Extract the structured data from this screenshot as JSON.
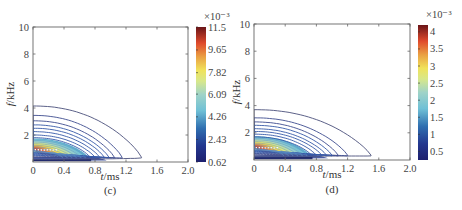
{
  "chart_data": [
    {
      "type": "contour",
      "panel_label": "(c)",
      "title": "",
      "xlabel": "t/ms",
      "ylabel": "f/kHz",
      "xlim": [
        0,
        2.0
      ],
      "ylim": [
        0,
        10
      ],
      "x_ticks": [
        "0",
        "0.4",
        "0.8",
        "1.2",
        "1.6",
        "2.0"
      ],
      "x_tick_values": [
        0,
        0.4,
        0.8,
        1.2,
        1.6,
        2.0
      ],
      "y_ticks": [
        "2",
        "4",
        "6",
        "8",
        "10"
      ],
      "y_tick_values": [
        2,
        4,
        6,
        8,
        10
      ],
      "grid": false,
      "colorbar": {
        "exponent_label": "×10⁻³",
        "ticks": [
          "11.5",
          "9.65",
          "7.82",
          "6.09",
          "4.26",
          "2.43",
          "0.62"
        ],
        "range": [
          0.62,
          11.5
        ],
        "colormap": "jet-like (dark blue → cyan → yellow → red → dark red)"
      },
      "peak": {
        "t": 0,
        "f": 0.9,
        "value": 11.5
      },
      "contour_outer_extents": [
        {
          "f0": 4.15,
          "t_end": 1.4
        },
        {
          "f0": 3.45,
          "t_end": 1.15
        },
        {
          "f0": 3.05,
          "t_end": 1.05
        },
        {
          "f0": 2.75,
          "t_end": 0.98
        },
        {
          "f0": 2.5,
          "t_end": 0.92
        },
        {
          "f0": 2.25,
          "t_end": 0.86
        },
        {
          "f0": 2.0,
          "t_end": 0.8
        },
        {
          "f0": 1.8,
          "t_end": 0.74
        }
      ]
    },
    {
      "type": "contour",
      "panel_label": "(d)",
      "title": "",
      "xlabel": "t/ms",
      "ylabel": "f/kHz",
      "xlim": [
        0,
        2.0
      ],
      "ylim": [
        0,
        10
      ],
      "x_ticks": [
        "0",
        "0.4",
        "0.8",
        "1.2",
        "1.6",
        "2.0"
      ],
      "x_tick_values": [
        0,
        0.4,
        0.8,
        1.2,
        1.6,
        2.0
      ],
      "y_ticks": [
        "2",
        "4",
        "6",
        "8",
        "10"
      ],
      "y_tick_values": [
        2,
        4,
        6,
        8,
        10
      ],
      "grid": false,
      "colorbar": {
        "exponent_label": "×10⁻³",
        "ticks": [
          "4",
          "3.5",
          "3",
          "2.5",
          "2",
          "1.5",
          "1",
          "0.5"
        ],
        "range": [
          0.25,
          4.2
        ],
        "colormap": "jet-like (dark blue → cyan → yellow → red → dark red)"
      },
      "peak": {
        "t": 0,
        "f": 0.9,
        "value": 4.2
      },
      "contour_outer_extents": [
        {
          "f0": 3.7,
          "t_end": 1.5
        },
        {
          "f0": 3.1,
          "t_end": 1.2
        },
        {
          "f0": 2.8,
          "t_end": 1.08
        },
        {
          "f0": 2.55,
          "t_end": 1.0
        },
        {
          "f0": 2.3,
          "t_end": 0.93
        },
        {
          "f0": 2.1,
          "t_end": 0.87
        },
        {
          "f0": 1.9,
          "t_end": 0.8
        },
        {
          "f0": 1.7,
          "t_end": 0.74
        }
      ]
    }
  ],
  "panels": {
    "c": {
      "label": "(c)",
      "xlabel_italic": "t",
      "xlabel_unit": "/ms",
      "ylabel_italic": "f",
      "ylabel_unit": "/kHz"
    },
    "d": {
      "label": "(d)",
      "xlabel_italic": "t",
      "xlabel_unit": "/ms",
      "ylabel_italic": "f",
      "ylabel_unit": "/kHz"
    }
  }
}
